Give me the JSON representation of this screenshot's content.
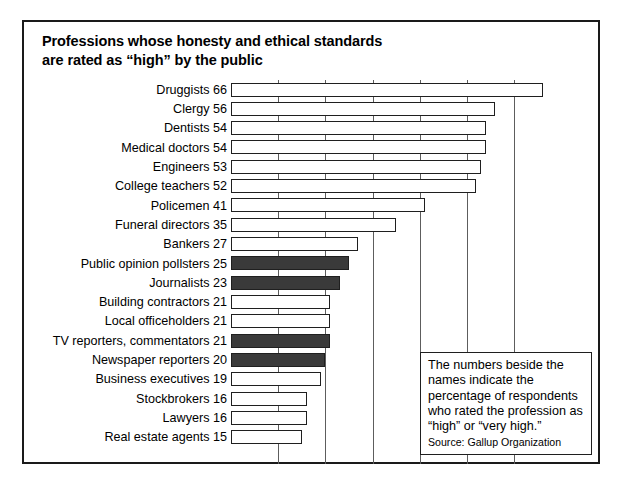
{
  "chart_data": {
    "type": "bar",
    "orientation": "horizontal",
    "title": "Professions whose honesty and ethical standards are rated as “high” by the public",
    "title_lines": [
      "Professions whose honesty and ethical standards",
      "are rated as “high” by the public"
    ],
    "xlabel": "",
    "ylabel": "",
    "xlim": [
      0,
      70
    ],
    "grid": true,
    "gridlines": [
      10,
      20,
      30,
      40,
      50,
      60
    ],
    "legend": "none",
    "categories": [
      "Druggists",
      "Clergy",
      "Dentists",
      "Medical doctors",
      "Engineers",
      "College teachers",
      "Policemen",
      "Funeral directors",
      "Bankers",
      "Public opinion pollsters",
      "Journalists",
      "Building contractors",
      "Local officeholders",
      "TV reporters, commentators",
      "Newspaper reporters",
      "Business executives",
      "Stockbrokers",
      "Lawyers",
      "Real estate agents"
    ],
    "values": [
      66,
      56,
      54,
      54,
      53,
      52,
      41,
      35,
      27,
      25,
      23,
      21,
      21,
      21,
      20,
      19,
      16,
      16,
      15
    ],
    "highlighted": [
      "Public opinion pollsters",
      "Journalists",
      "TV reporters, commentators",
      "Newspaper reporters"
    ],
    "bars": [
      {
        "label": "Druggists",
        "value": 66,
        "text": "Druggists 66",
        "filled": false
      },
      {
        "label": "Clergy",
        "value": 56,
        "text": "Clergy 56",
        "filled": false
      },
      {
        "label": "Dentists",
        "value": 54,
        "text": "Dentists 54",
        "filled": false
      },
      {
        "label": "Medical doctors",
        "value": 54,
        "text": "Medical doctors 54",
        "filled": false
      },
      {
        "label": "Engineers",
        "value": 53,
        "text": "Engineers 53",
        "filled": false
      },
      {
        "label": "College teachers",
        "value": 52,
        "text": "College teachers 52",
        "filled": false
      },
      {
        "label": "Policemen",
        "value": 41,
        "text": "Policemen 41",
        "filled": false
      },
      {
        "label": "Funeral directors",
        "value": 35,
        "text": "Funeral directors 35",
        "filled": false
      },
      {
        "label": "Bankers",
        "value": 27,
        "text": "Bankers 27",
        "filled": false
      },
      {
        "label": "Public opinion pollsters",
        "value": 25,
        "text": "Public opinion pollsters 25",
        "filled": true
      },
      {
        "label": "Journalists",
        "value": 23,
        "text": "Journalists 23",
        "filled": true
      },
      {
        "label": "Building contractors",
        "value": 21,
        "text": "Building contractors 21",
        "filled": false
      },
      {
        "label": "Local officeholders",
        "value": 21,
        "text": "Local officeholders 21",
        "filled": false
      },
      {
        "label": "TV reporters, commentators",
        "value": 21,
        "text": "TV reporters, commentators 21",
        "filled": true
      },
      {
        "label": "Newspaper reporters",
        "value": 20,
        "text": "Newspaper reporters 20",
        "filled": true
      },
      {
        "label": "Business executives",
        "value": 19,
        "text": "Business executives 19",
        "filled": false
      },
      {
        "label": "Stockbrokers",
        "value": 16,
        "text": "Stockbrokers 16",
        "filled": false
      },
      {
        "label": "Lawyers",
        "value": 16,
        "text": "Lawyers 16",
        "filled": false
      },
      {
        "label": "Real estate agents",
        "value": 15,
        "text": "Real estate agents 15",
        "filled": false
      }
    ],
    "annotation": {
      "text": "The numbers beside the names indicate the percentage of respondents who rated the profession as “high” or “very high.”",
      "source": "Source: Gallup Organization"
    }
  },
  "colors": {
    "frame": "#1a1a1a",
    "bar_outline": "#1f1f1f",
    "bar_fill_empty": "#ffffff",
    "bar_fill_highlight": "#3a3a3a",
    "gridline": "#5d5d5d",
    "background": "#ffffff",
    "text": "#000000"
  }
}
